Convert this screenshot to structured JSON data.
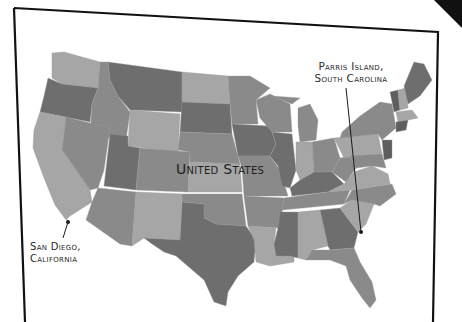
{
  "map": {
    "title": "United States",
    "colors": {
      "background": "#ffffff",
      "frame": "#111111",
      "state_dark": "#6e6e6e",
      "state_mid": "#8a8a8a",
      "state_light": "#a6a6a6",
      "state_lighter": "#b4b4b4",
      "label": "#2a2a2a"
    },
    "markers": [
      {
        "id": "parris-island",
        "label_line1": "Parris Island,",
        "label_line2": "South Carolina",
        "x": 361,
        "y": 232
      },
      {
        "id": "san-diego",
        "label_line1": "San Diego,",
        "label_line2": "California",
        "x": 68,
        "y": 222
      }
    ]
  }
}
